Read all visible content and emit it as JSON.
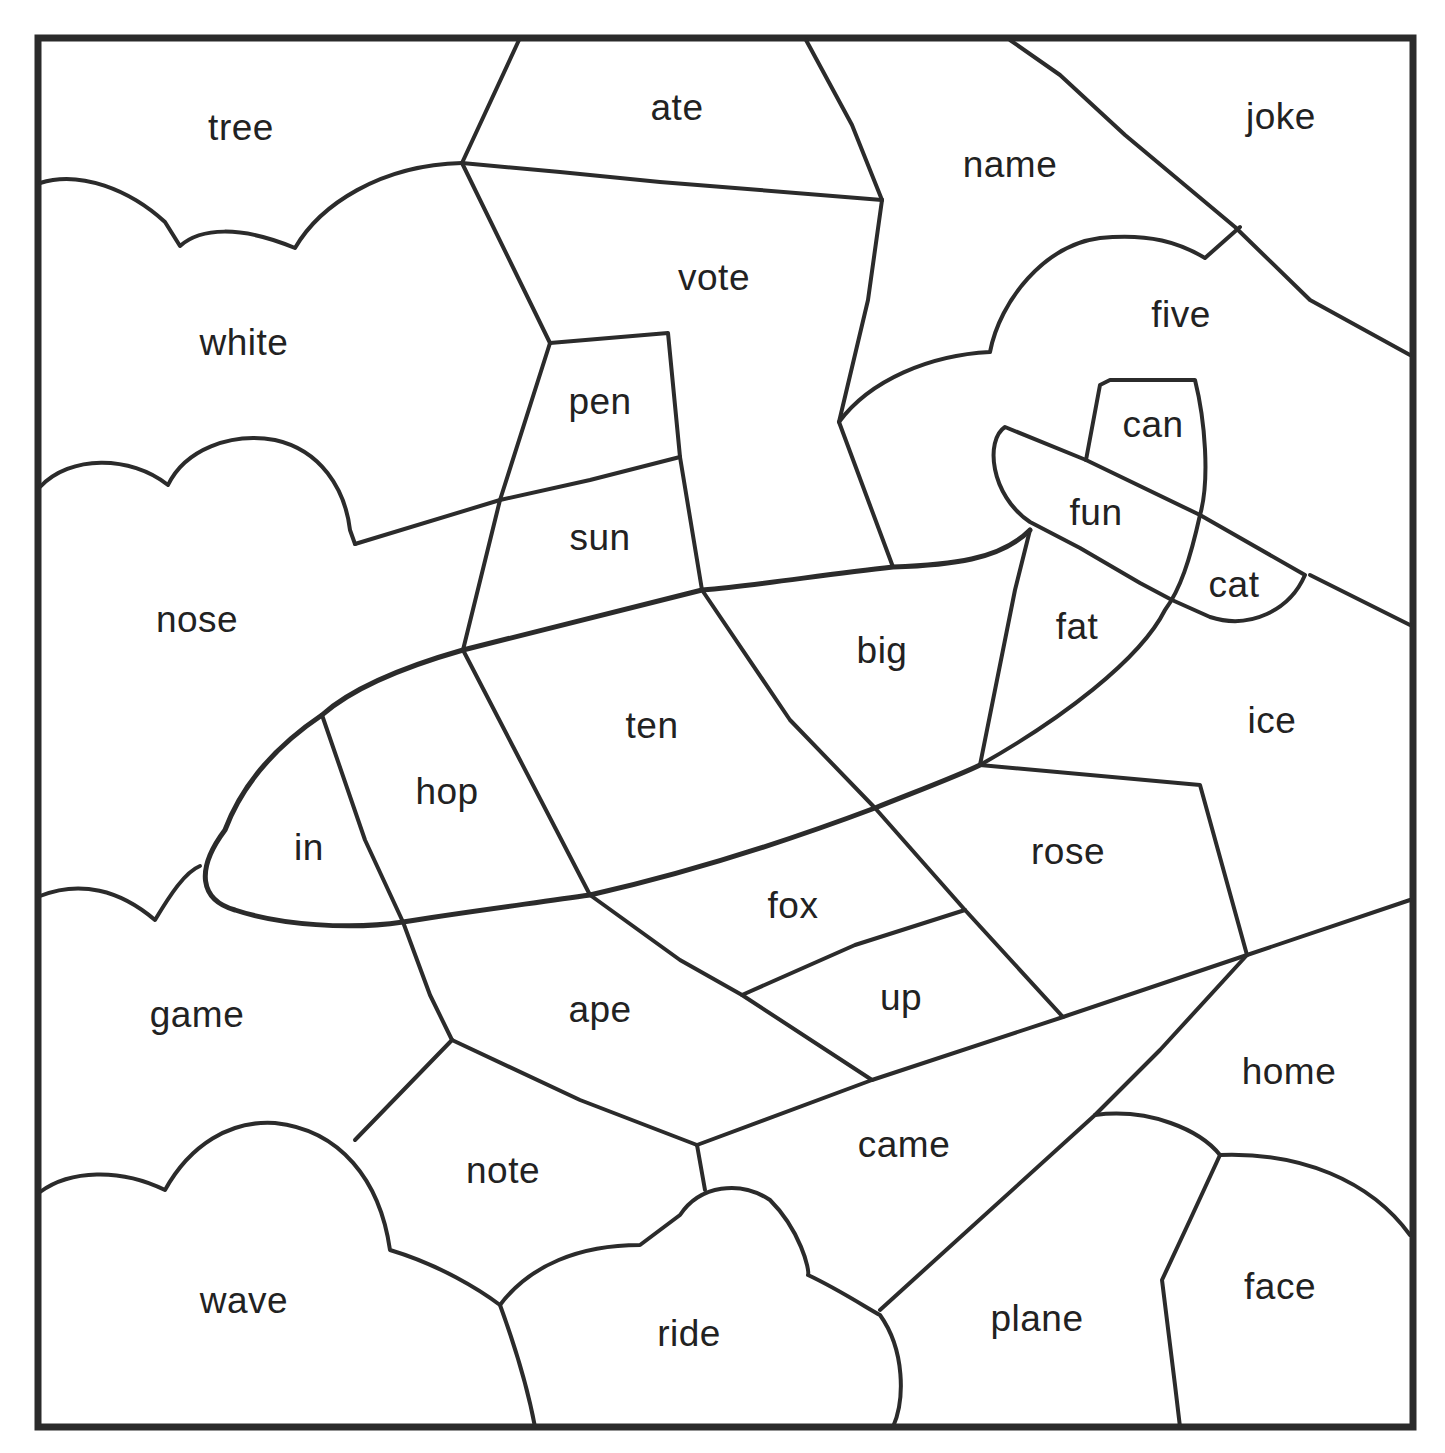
{
  "worksheet": {
    "type": "color-by-word puzzle",
    "colors": {
      "line": "#2b2b2b",
      "text": "#222222",
      "background": "#ffffff"
    },
    "words": [
      {
        "id": "tree",
        "label": "tree",
        "x": 241,
        "y": 127
      },
      {
        "id": "ate",
        "label": "ate",
        "x": 677,
        "y": 107
      },
      {
        "id": "name",
        "label": "name",
        "x": 1010,
        "y": 164
      },
      {
        "id": "joke",
        "label": "joke",
        "x": 1281,
        "y": 116
      },
      {
        "id": "white",
        "label": "white",
        "x": 244,
        "y": 342
      },
      {
        "id": "vote",
        "label": "vote",
        "x": 714,
        "y": 277
      },
      {
        "id": "five",
        "label": "five",
        "x": 1181,
        "y": 314
      },
      {
        "id": "pen",
        "label": "pen",
        "x": 600,
        "y": 401
      },
      {
        "id": "can",
        "label": "can",
        "x": 1153,
        "y": 424
      },
      {
        "id": "sun",
        "label": "sun",
        "x": 600,
        "y": 537
      },
      {
        "id": "fun",
        "label": "fun",
        "x": 1096,
        "y": 512
      },
      {
        "id": "cat",
        "label": "cat",
        "x": 1234,
        "y": 584
      },
      {
        "id": "nose",
        "label": "nose",
        "x": 197,
        "y": 619
      },
      {
        "id": "fat",
        "label": "fat",
        "x": 1077,
        "y": 626
      },
      {
        "id": "big",
        "label": "big",
        "x": 882,
        "y": 650
      },
      {
        "id": "ice",
        "label": "ice",
        "x": 1272,
        "y": 720
      },
      {
        "id": "ten",
        "label": "ten",
        "x": 652,
        "y": 725
      },
      {
        "id": "hop",
        "label": "hop",
        "x": 447,
        "y": 791
      },
      {
        "id": "in",
        "label": "in",
        "x": 309,
        "y": 847
      },
      {
        "id": "rose",
        "label": "rose",
        "x": 1068,
        "y": 851
      },
      {
        "id": "fox",
        "label": "fox",
        "x": 793,
        "y": 905
      },
      {
        "id": "up",
        "label": "up",
        "x": 901,
        "y": 997
      },
      {
        "id": "game",
        "label": "game",
        "x": 197,
        "y": 1014
      },
      {
        "id": "ape",
        "label": "ape",
        "x": 600,
        "y": 1009
      },
      {
        "id": "home",
        "label": "home",
        "x": 1289,
        "y": 1071
      },
      {
        "id": "came",
        "label": "came",
        "x": 904,
        "y": 1144
      },
      {
        "id": "note",
        "label": "note",
        "x": 503,
        "y": 1170
      },
      {
        "id": "face",
        "label": "face",
        "x": 1280,
        "y": 1286
      },
      {
        "id": "wave",
        "label": "wave",
        "x": 244,
        "y": 1300
      },
      {
        "id": "plane",
        "label": "plane",
        "x": 1037,
        "y": 1318
      },
      {
        "id": "ride",
        "label": "ride",
        "x": 689,
        "y": 1333
      }
    ]
  }
}
